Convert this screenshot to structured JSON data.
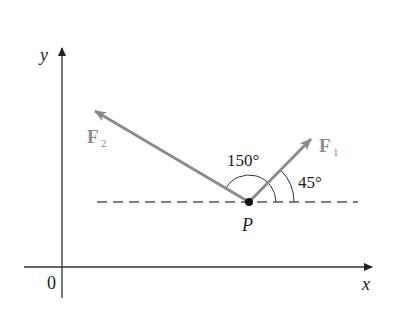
{
  "diagram": {
    "axes": {
      "x_label": "x",
      "y_label": "y",
      "origin_label": "0"
    },
    "point": {
      "label": "P"
    },
    "vectors": [
      {
        "name": "F1",
        "label": "F",
        "subscript": "1",
        "angle_deg": 45
      },
      {
        "name": "F2",
        "label": "F",
        "subscript": "2",
        "angle_deg": 150
      }
    ],
    "angle_labels": {
      "f1": "45°",
      "f2": "150°"
    },
    "colors": {
      "axis": "#333333",
      "vector": "#8c8c8c",
      "vector_label": "#8c8c8c",
      "text": "#222222",
      "dash": "#555555"
    }
  }
}
